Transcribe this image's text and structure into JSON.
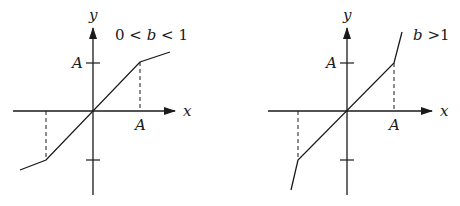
{
  "panels": [
    {
      "id": "left",
      "condition_label": "0 < b < 1",
      "x_axis_label": "x",
      "y_axis_label": "y",
      "x_tick_label": "A",
      "y_tick_label": "A"
    },
    {
      "id": "right",
      "condition_label": "b >1",
      "x_axis_label": "x",
      "y_axis_label": "y",
      "x_tick_label": "A",
      "y_tick_label": "A"
    }
  ],
  "colors": {
    "ink": "#1a1a1a",
    "background": "#ffffff"
  }
}
